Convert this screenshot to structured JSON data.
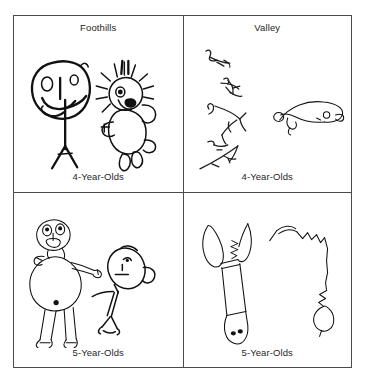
{
  "figure": {
    "kind": "2x2 comparison panel of children's human-figure drawings",
    "columns": [
      "Foothills",
      "Valley"
    ],
    "rows": [
      "4-Year-Olds",
      "5-Year-Olds"
    ]
  },
  "panels": [
    {
      "id": "foothills-4",
      "site_label": "Foothills",
      "age_label": "4-Year-Olds",
      "drawings": [
        {
          "name": "tadpole-figure-smiling-face",
          "description": "Large oval head with two eyes, vertical nose stroke, curved smile, arms and legs extending directly from the head"
        },
        {
          "name": "spiky-haired-figure",
          "description": "Round head with radiating spiky hair lines, dark filled eyes, oval body, short arms and two feet"
        }
      ]
    },
    {
      "id": "valley-4",
      "site_label": "Valley",
      "age_label": "4-Year-Olds",
      "drawings": [
        {
          "name": "scribble-marks-column",
          "description": "Series of faint disconnected scribbled marks arranged vertically, no recognizable figure"
        },
        {
          "name": "elongated-blob-creature",
          "description": "Low horizontal looping outline resembling an elongated blob with small circular end"
        }
      ]
    },
    {
      "id": "foothills-5",
      "site_label": "",
      "age_label": "5-Year-Olds",
      "drawings": [
        {
          "name": "round-body-figure-with-limbs",
          "description": "Head with eyes and open mouth, large round torso, outstretched arms, two long legs with feet"
        },
        {
          "name": "tilted-head-stick-figure",
          "description": "Tilted oval head with eye, nose and mouth, ear loop, thin stick body with legs"
        }
      ]
    },
    {
      "id": "valley-5",
      "site_label": "",
      "age_label": "5-Year-Olds",
      "drawings": [
        {
          "name": "vertical-pronged-form",
          "description": "Tall narrow vertical form with two prongs at the top and a rounded base containing two small dots"
        },
        {
          "name": "angular-line-with-loop",
          "description": "Meandering angular line descending to a small closed loop at the bottom"
        }
      ]
    }
  ]
}
